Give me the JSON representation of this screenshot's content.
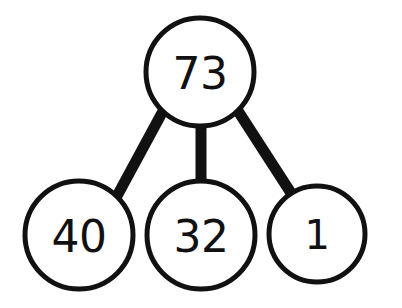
{
  "diagram": {
    "type": "number-bond",
    "background_color": "#ffffff",
    "stroke_color": "#111111",
    "text_color": "#111111",
    "circle_stroke_width": 5,
    "edge_stroke_width": 11,
    "whole": {
      "id": "root",
      "value": "73",
      "cx": 200,
      "cy": 72,
      "r": 54,
      "font_size": 44
    },
    "parts": [
      {
        "id": "part-left",
        "value": "40",
        "cx": 79,
        "cy": 235,
        "r": 54,
        "font_size": 44
      },
      {
        "id": "part-middle",
        "value": "32",
        "cx": 201,
        "cy": 235,
        "r": 54,
        "font_size": 44
      },
      {
        "id": "part-right",
        "value": "1",
        "cx": 317,
        "cy": 234,
        "r": 48,
        "font_size": 40
      }
    ],
    "edges": [
      {
        "id": "edge-root-left",
        "from": "root",
        "to": "part-left",
        "x1": 163,
        "y1": 111,
        "x2": 117,
        "y2": 196
      },
      {
        "id": "edge-root-middle",
        "from": "root",
        "to": "part-middle",
        "x1": 201,
        "y1": 125,
        "x2": 201,
        "y2": 182
      },
      {
        "id": "edge-root-right",
        "from": "root",
        "to": "part-right",
        "x1": 238,
        "y1": 111,
        "x2": 291,
        "y2": 193
      }
    ]
  }
}
